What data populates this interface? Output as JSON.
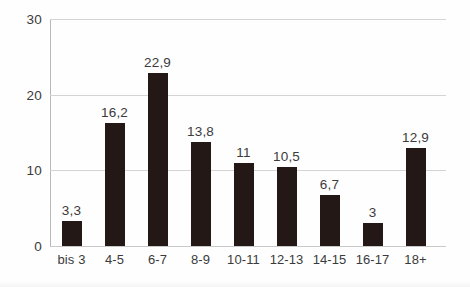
{
  "chart_data": {
    "type": "bar",
    "title": "",
    "subtitle": "",
    "xlabel": "",
    "ylabel": "",
    "categories": [
      "bis 3",
      "4-5",
      "6-7",
      "8-9",
      "10-11",
      "12-13",
      "14-15",
      "16-17",
      "18+"
    ],
    "values": [
      3.3,
      16.2,
      22.9,
      13.8,
      11,
      10.5,
      6.7,
      3,
      12.9
    ],
    "value_labels": [
      "3,3",
      "16,2",
      "22,9",
      "13,8",
      "11",
      "10,5",
      "6,7",
      "3",
      "12,9"
    ],
    "ylim": [
      0,
      30
    ],
    "y_ticks": [
      0,
      10,
      20,
      30
    ],
    "y_tick_labels": [
      "0",
      "10",
      "20",
      "30"
    ],
    "grid": true,
    "legend": false,
    "legend_position": "none",
    "bar_color": "#231815",
    "gridline_color": "#d4d4d4",
    "axis_color": "#b8b8b8",
    "text_color": "#3b3b3b",
    "background_color": "#ffffff",
    "decimal_separator": ","
  }
}
